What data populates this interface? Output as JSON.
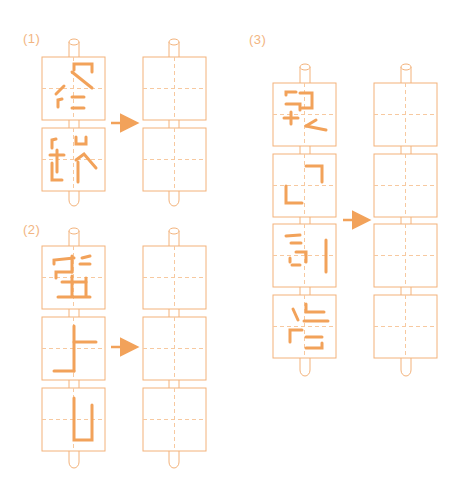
{
  "colors": {
    "outline": "#f3b27a",
    "guide": "#f7c9a0",
    "stroke": "#f2a25a",
    "arrow": "#f2a25a",
    "label": "#f2b582"
  },
  "problems": [
    {
      "label": "(1)",
      "description": "Two upside-down character tiles on a rotating rod, to be rotated into blank tiles",
      "source_tiles": 2,
      "target_tiles": 2
    },
    {
      "label": "(2)",
      "description": "Three upside-down character tiles on a rotating rod, to be rotated into blank tiles",
      "source_tiles": 3,
      "target_tiles": 3
    },
    {
      "label": "(3)",
      "description": "Four upside-down character tiles on a rotating rod, to be rotated into blank tiles",
      "source_tiles": 4,
      "target_tiles": 4
    }
  ]
}
